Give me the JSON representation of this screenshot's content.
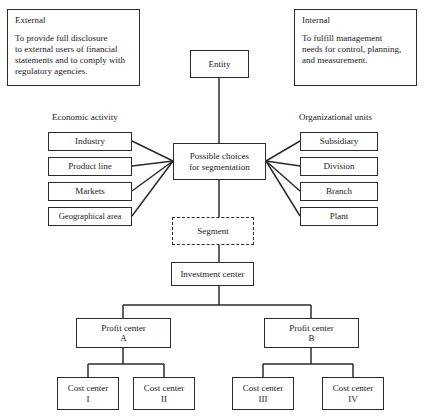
{
  "diagram": {
    "title": "Possible choices for segmentation",
    "notes": [
      {
        "id": "external",
        "title": "External",
        "body": "To provide full disclosure\nto external users of financial\nstatements and to comply with\nregulatory agencies."
      },
      {
        "id": "internal",
        "title": "Internal",
        "body": "To fulfill management\nneeds for control, planning,\nand measurement."
      }
    ],
    "root": {
      "label": "Entity"
    },
    "hub": {
      "label": "Possible choices\nfor segmentation"
    },
    "left_group": {
      "label": "Economic activity",
      "items": [
        {
          "label": "Industry"
        },
        {
          "label": "Product line"
        },
        {
          "label": "Markets"
        },
        {
          "label": "Geographical area"
        }
      ]
    },
    "right_group": {
      "label": "Organizational units",
      "items": [
        {
          "label": "Subsidiary"
        },
        {
          "label": "Division"
        },
        {
          "label": "Branch"
        },
        {
          "label": "Plant"
        }
      ]
    },
    "segment": {
      "label": "Segment",
      "style": "dashed"
    },
    "investment_center": {
      "label": "Investment center"
    },
    "profit_centers": [
      {
        "label": "Profit center\nA"
      },
      {
        "label": "Profit center\nB"
      }
    ],
    "cost_centers": [
      {
        "label": "Cost center\nI"
      },
      {
        "label": "Cost center\nII"
      },
      {
        "label": "Cost center\nIII"
      },
      {
        "label": "Cost center\nIV"
      }
    ],
    "colors": {
      "line": "#2b2b2b",
      "background": "#ffffff",
      "text": "#1a1a1a"
    }
  }
}
